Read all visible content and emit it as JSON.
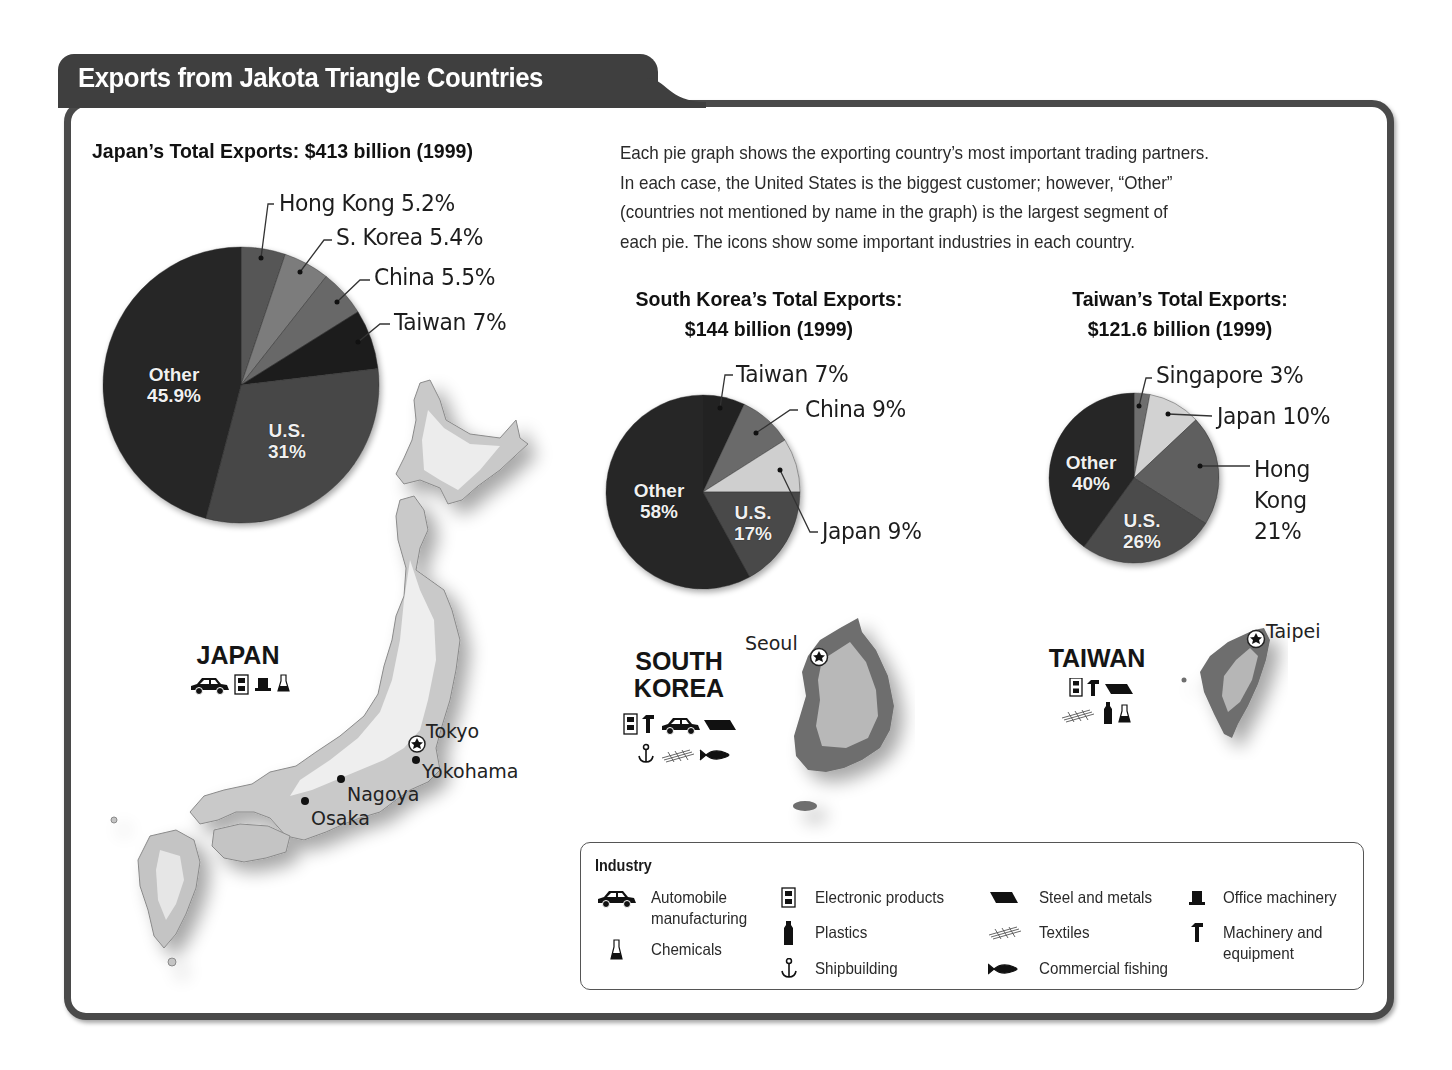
{
  "title": "Exports from Jakota Triangle Countries",
  "intro_text": "Each pie graph shows the exporting country’s most important trading partners. In each case, the United States is the biggest customer; however, “Other” (countries not mentioned by name in the graph) is the largest segment of each pie. The icons show some important industries in each country.",
  "intro_lines": [
    "Each pie graph shows the exporting country’s most important trading partners.",
    "In each case, the United States is the biggest customer; however, “Other”",
    "(countries not mentioned by name in the graph) is the largest segment of",
    "each pie. The icons show some important industries in each country."
  ],
  "colors": {
    "frame": "#4a4a4a",
    "title_bg": "#3f3f3f",
    "darkest": "#262626",
    "dark": "#3b3b3b",
    "mid": "#5a5a5a",
    "midlight": "#7a7a7a",
    "light": "#cfcfcf"
  },
  "chart_data": [
    {
      "type": "pie",
      "title": "Japan’s Total Exports: $413 billion (1999)",
      "categories": [
        "Hong Kong",
        "S. Korea",
        "China",
        "Taiwan",
        "U.S.",
        "Other"
      ],
      "values": [
        5.2,
        5.4,
        5.5,
        7,
        31,
        45.9
      ],
      "unit": "%",
      "labels": [
        "Hong Kong 5.2%",
        "S. Korea 5.4%",
        "China 5.5%",
        "Taiwan 7%",
        "U.S. 31%",
        "Other 45.9%"
      ],
      "start_angle": "12 o'clock, clockwise"
    },
    {
      "type": "pie",
      "title": "South Korea’s Total Exports: $144 billion (1999)",
      "categories": [
        "Taiwan",
        "China",
        "Japan",
        "U.S.",
        "Other"
      ],
      "values": [
        7,
        9,
        9,
        17,
        58
      ],
      "unit": "%",
      "labels": [
        "Taiwan 7%",
        "China 9%",
        "Japan 9%",
        "U.S. 17%",
        "Other 58%"
      ],
      "start_angle": "12 o'clock, clockwise"
    },
    {
      "type": "pie",
      "title": "Taiwan’s Total Exports: $121.6 billion (1999)",
      "categories": [
        "Singapore",
        "Japan",
        "Hong Kong",
        "U.S.",
        "Other"
      ],
      "values": [
        3,
        10,
        21,
        26,
        40
      ],
      "unit": "%",
      "labels": [
        "Singapore 3%",
        "Japan 10%",
        "Hong Kong 21%",
        "U.S. 26%",
        "Other 40%"
      ],
      "start_angle": "12 o'clock, clockwise"
    }
  ],
  "japan": {
    "pie_title": "Japan’s Total Exports: $413 billion (1999)",
    "labels": {
      "hong_kong": "Hong Kong 5.2%",
      "s_korea": "S. Korea 5.4%",
      "china": "China 5.5%",
      "taiwan": "Taiwan 7%",
      "us_name": "U.S.",
      "us_pct": "31%",
      "other_name": "Other",
      "other_pct": "45.9%"
    },
    "map": {
      "country_name": "JAPAN",
      "industries": [
        "automobile",
        "electronic-products",
        "office-machinery",
        "chemicals"
      ],
      "cities": [
        {
          "name": "Tokyo",
          "capital": true
        },
        {
          "name": "Yokohama",
          "capital": false
        },
        {
          "name": "Nagoya",
          "capital": false
        },
        {
          "name": "Osaka",
          "capital": false
        }
      ]
    }
  },
  "south_korea": {
    "pie_title_line1": "South Korea’s Total Exports:",
    "pie_title_line2": "$144 billion (1999)",
    "labels": {
      "taiwan": "Taiwan 7%",
      "china": "China 9%",
      "japan": "Japan 9%",
      "us_name": "U.S.",
      "us_pct": "17%",
      "other_name": "Other",
      "other_pct": "58%"
    },
    "map": {
      "country_name_line1": "SOUTH",
      "country_name_line2": "KOREA",
      "industries": [
        "electronic-products",
        "machinery-equipment",
        "automobile",
        "steel-metals",
        "shipbuilding",
        "textiles",
        "commercial-fishing"
      ],
      "cities": [
        {
          "name": "Seoul",
          "capital": true
        }
      ]
    }
  },
  "taiwan": {
    "pie_title_line1": "Taiwan’s Total Exports:",
    "pie_title_line2": "$121.6 billion (1999)",
    "labels": {
      "singapore": "Singapore 3%",
      "japan": "Japan 10%",
      "hong_kong_line1": "Hong",
      "hong_kong_line2": "Kong",
      "hong_kong_line3": "21%",
      "us_name": "U.S.",
      "us_pct": "26%",
      "other_name": "Other",
      "other_pct": "40%"
    },
    "map": {
      "country_name": "TAIWAN",
      "industries": [
        "electronic-products",
        "machinery-equipment",
        "steel-metals",
        "textiles",
        "plastics",
        "chemicals"
      ],
      "cities": [
        {
          "name": "Taipei",
          "capital": true
        }
      ]
    }
  },
  "legend": {
    "title": "Industry",
    "items": [
      {
        "icon": "car-icon",
        "label": "Automobile manufacturing",
        "line1": "Automobile",
        "line2": "manufacturing"
      },
      {
        "icon": "flask-icon",
        "label": "Chemicals"
      },
      {
        "icon": "electronics-icon",
        "label": "Electronic products"
      },
      {
        "icon": "bottle-icon",
        "label": "Plastics"
      },
      {
        "icon": "anchor-icon",
        "label": "Shipbuilding"
      },
      {
        "icon": "steel-icon",
        "label": "Steel and metals"
      },
      {
        "icon": "textiles-icon",
        "label": "Textiles"
      },
      {
        "icon": "fish-icon",
        "label": "Commercial fishing"
      },
      {
        "icon": "office-machine-icon",
        "label": "Office machinery"
      },
      {
        "icon": "machinery-icon",
        "label": "Machinery and equipment",
        "line1": "Machinery and",
        "line2": "equipment"
      }
    ]
  }
}
